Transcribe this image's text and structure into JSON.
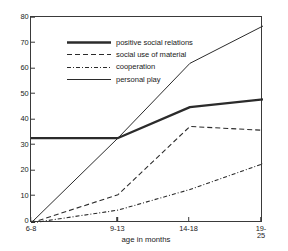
{
  "chart_data": {
    "type": "line",
    "title": "",
    "xlabel": "age in months",
    "ylabel": "",
    "categories": [
      "6-8",
      "9-13",
      "14-18",
      "19-25"
    ],
    "ylim": [
      0,
      80
    ],
    "yticks": [
      0,
      10,
      20,
      30,
      40,
      50,
      60,
      70,
      80
    ],
    "grid": false,
    "legend_position": "top-left",
    "series": [
      {
        "name": "positive social relations",
        "style": "solid-thick",
        "values": [
          33,
          33,
          45,
          48
        ]
      },
      {
        "name": "social use of material",
        "style": "dashed",
        "values": [
          0,
          11,
          37.5,
          36
        ]
      },
      {
        "name": "cooperation",
        "style": "dash-dot",
        "values": [
          0,
          5,
          13,
          23
        ]
      },
      {
        "name": "personal play",
        "style": "solid-thin",
        "values": [
          0,
          33,
          62,
          76.5
        ]
      }
    ]
  },
  "axis": {
    "y_tick_labels": [
      "0",
      "10",
      "20",
      "30",
      "40",
      "50",
      "60",
      "70",
      "80"
    ],
    "x_tick_labels": [
      "6-8",
      "9-13",
      "14-18",
      "19-25"
    ],
    "x_title": "age in months"
  },
  "legend": {
    "entries": [
      {
        "label": "positive social relations"
      },
      {
        "label": "social use of material"
      },
      {
        "label": "cooperation"
      },
      {
        "label": "personal play"
      }
    ]
  },
  "colors": {
    "line": "#2b2b2b",
    "axis": "#3a3a3a",
    "text": "#1a1a1a",
    "background": "#ffffff"
  }
}
